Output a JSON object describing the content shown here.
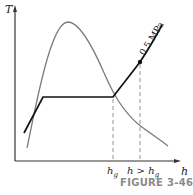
{
  "diagram": {
    "type": "T-h diagram",
    "axes": {
      "y_label": "T",
      "x_label": "h"
    },
    "x_ticks": [
      {
        "base": "h",
        "sub": "g",
        "prefix": ""
      },
      {
        "base": "h",
        "sub": "g",
        "prefix": "h > "
      }
    ],
    "pressure_line_label": "0.5 MPa",
    "caption": "FIGURE 3-46",
    "colors": {
      "dome": "#7a7a7a",
      "pressure_line": "#111111",
      "axes": "#333333",
      "dashed": "#888888",
      "caption": "#8a8a8a"
    }
  }
}
